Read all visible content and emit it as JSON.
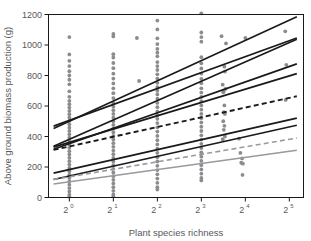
{
  "chart_data": {
    "type": "scatter",
    "title": "",
    "xlabel": "Plant species richness",
    "ylabel": "Above ground biomass production (g)",
    "xtick_labels": [
      "2",
      "2",
      "2",
      "2",
      "2",
      "2"
    ],
    "xtick_exponents": [
      "0",
      "1",
      "2",
      "3",
      "4",
      "5"
    ],
    "xtick_values": [
      1,
      2,
      4,
      8,
      16,
      32
    ],
    "xscale": "log2",
    "xlim": [
      0.72,
      40
    ],
    "ytick_labels": [
      "0",
      "200",
      "400",
      "600",
      "800",
      "1000",
      "1200"
    ],
    "ytick_values": [
      0,
      200,
      400,
      600,
      800,
      1000,
      1200
    ],
    "ylim": [
      0,
      1200
    ],
    "grid": false,
    "legend": "none",
    "series": [
      {
        "name": "regression-line-1",
        "style": "solid",
        "color": "#1a1a1a",
        "width": 1.7,
        "x": [
          0.78,
          36
        ],
        "y": [
          452,
          1185
        ]
      },
      {
        "name": "regression-line-2",
        "style": "solid",
        "color": "#1a1a1a",
        "width": 1.7,
        "x": [
          0.78,
          36
        ],
        "y": [
          468,
          1046
        ]
      },
      {
        "name": "regression-line-3",
        "style": "solid",
        "color": "#1a1a1a",
        "width": 1.7,
        "x": [
          0.78,
          36
        ],
        "y": [
          336,
          1038
        ]
      },
      {
        "name": "regression-line-4",
        "style": "solid",
        "color": "#1a1a1a",
        "width": 1.7,
        "x": [
          0.78,
          36
        ],
        "y": [
          316,
          876
        ]
      },
      {
        "name": "regression-line-5",
        "style": "solid",
        "color": "#1a1a1a",
        "width": 1.7,
        "x": [
          0.78,
          36
        ],
        "y": [
          330,
          812
        ]
      },
      {
        "name": "regression-line-dashed-black",
        "style": "dashed",
        "color": "#1a1a1a",
        "width": 1.9,
        "x": [
          0.78,
          36
        ],
        "y": [
          312,
          664
        ]
      },
      {
        "name": "regression-line-6",
        "style": "solid",
        "color": "#1a1a1a",
        "width": 1.7,
        "x": [
          0.78,
          36
        ],
        "y": [
          160,
          520
        ]
      },
      {
        "name": "regression-line-7",
        "style": "solid",
        "color": "#1a1a1a",
        "width": 1.7,
        "x": [
          0.78,
          36
        ],
        "y": [
          118,
          474
        ]
      },
      {
        "name": "regression-line-dashed-gray",
        "style": "dashed",
        "color": "#9a9a9e",
        "width": 1.6,
        "x": [
          0.78,
          36
        ],
        "y": [
          118,
          390
        ]
      },
      {
        "name": "regression-line-gray",
        "style": "solid",
        "color": "#9a9a9e",
        "width": 1.6,
        "x": [
          0.78,
          36
        ],
        "y": [
          88,
          310
        ]
      }
    ],
    "point_color": "#8c8c90",
    "points": [
      {
        "x": 1,
        "y": 1052
      },
      {
        "x": 1,
        "y": 938
      },
      {
        "x": 1,
        "y": 896
      },
      {
        "x": 1,
        "y": 862
      },
      {
        "x": 1,
        "y": 828
      },
      {
        "x": 1,
        "y": 800
      },
      {
        "x": 1,
        "y": 772
      },
      {
        "x": 1,
        "y": 742
      },
      {
        "x": 1,
        "y": 696
      },
      {
        "x": 1,
        "y": 660
      },
      {
        "x": 1,
        "y": 634
      },
      {
        "x": 1,
        "y": 612
      },
      {
        "x": 1,
        "y": 590
      },
      {
        "x": 1,
        "y": 568
      },
      {
        "x": 1,
        "y": 546
      },
      {
        "x": 1,
        "y": 524
      },
      {
        "x": 1,
        "y": 502
      },
      {
        "x": 1,
        "y": 480
      },
      {
        "x": 1,
        "y": 458
      },
      {
        "x": 1,
        "y": 436
      },
      {
        "x": 1,
        "y": 414
      },
      {
        "x": 1,
        "y": 392
      },
      {
        "x": 1,
        "y": 370
      },
      {
        "x": 1,
        "y": 348
      },
      {
        "x": 1,
        "y": 326
      },
      {
        "x": 1,
        "y": 304
      },
      {
        "x": 1,
        "y": 282
      },
      {
        "x": 1,
        "y": 260
      },
      {
        "x": 1,
        "y": 238
      },
      {
        "x": 1,
        "y": 216
      },
      {
        "x": 1,
        "y": 194
      },
      {
        "x": 1,
        "y": 172
      },
      {
        "x": 1,
        "y": 150
      },
      {
        "x": 1,
        "y": 128
      },
      {
        "x": 1,
        "y": 106
      },
      {
        "x": 1,
        "y": 84
      },
      {
        "x": 1,
        "y": 62
      },
      {
        "x": 1,
        "y": 40
      },
      {
        "x": 1,
        "y": 18
      },
      {
        "x": 1,
        "y": 6
      },
      {
        "x": 2,
        "y": 1072
      },
      {
        "x": 2,
        "y": 1056
      },
      {
        "x": 2,
        "y": 940
      },
      {
        "x": 2,
        "y": 918
      },
      {
        "x": 2,
        "y": 882
      },
      {
        "x": 2,
        "y": 848
      },
      {
        "x": 2,
        "y": 812
      },
      {
        "x": 2,
        "y": 780
      },
      {
        "x": 2,
        "y": 748
      },
      {
        "x": 2,
        "y": 716
      },
      {
        "x": 2,
        "y": 684
      },
      {
        "x": 2,
        "y": 652
      },
      {
        "x": 2,
        "y": 620
      },
      {
        "x": 2,
        "y": 596
      },
      {
        "x": 2,
        "y": 572
      },
      {
        "x": 2,
        "y": 548
      },
      {
        "x": 2,
        "y": 524
      },
      {
        "x": 2,
        "y": 500
      },
      {
        "x": 2,
        "y": 476
      },
      {
        "x": 2,
        "y": 452
      },
      {
        "x": 2,
        "y": 428
      },
      {
        "x": 2,
        "y": 404
      },
      {
        "x": 2,
        "y": 380
      },
      {
        "x": 2,
        "y": 356
      },
      {
        "x": 2,
        "y": 332
      },
      {
        "x": 2,
        "y": 308
      },
      {
        "x": 2,
        "y": 284
      },
      {
        "x": 2,
        "y": 260
      },
      {
        "x": 2,
        "y": 236
      },
      {
        "x": 2,
        "y": 212
      },
      {
        "x": 2,
        "y": 188
      },
      {
        "x": 2,
        "y": 164
      },
      {
        "x": 2,
        "y": 140
      },
      {
        "x": 2,
        "y": 116
      },
      {
        "x": 2,
        "y": 92
      },
      {
        "x": 2,
        "y": 68
      },
      {
        "x": 2,
        "y": 44
      },
      {
        "x": 2,
        "y": 20
      },
      {
        "x": 2,
        "y": 8
      },
      {
        "x": 2.9,
        "y": 1046
      },
      {
        "x": 3.0,
        "y": 764
      },
      {
        "x": 4,
        "y": 1160
      },
      {
        "x": 4,
        "y": 1102
      },
      {
        "x": 4,
        "y": 1044
      },
      {
        "x": 4,
        "y": 1006
      },
      {
        "x": 4,
        "y": 974
      },
      {
        "x": 4,
        "y": 950
      },
      {
        "x": 4,
        "y": 926
      },
      {
        "x": 4,
        "y": 888
      },
      {
        "x": 4,
        "y": 862
      },
      {
        "x": 4,
        "y": 836
      },
      {
        "x": 4,
        "y": 808
      },
      {
        "x": 4,
        "y": 780
      },
      {
        "x": 4,
        "y": 752
      },
      {
        "x": 4,
        "y": 724
      },
      {
        "x": 4,
        "y": 700
      },
      {
        "x": 4,
        "y": 676
      },
      {
        "x": 4,
        "y": 648
      },
      {
        "x": 4,
        "y": 620
      },
      {
        "x": 4,
        "y": 592
      },
      {
        "x": 4,
        "y": 564
      },
      {
        "x": 4,
        "y": 540
      },
      {
        "x": 4,
        "y": 516
      },
      {
        "x": 4,
        "y": 488
      },
      {
        "x": 4,
        "y": 460
      },
      {
        "x": 4,
        "y": 432
      },
      {
        "x": 4,
        "y": 404
      },
      {
        "x": 4,
        "y": 376
      },
      {
        "x": 4,
        "y": 348
      },
      {
        "x": 4,
        "y": 320
      },
      {
        "x": 4,
        "y": 292
      },
      {
        "x": 4,
        "y": 264
      },
      {
        "x": 4,
        "y": 236
      },
      {
        "x": 4,
        "y": 208
      },
      {
        "x": 4,
        "y": 180
      },
      {
        "x": 4,
        "y": 152
      },
      {
        "x": 4,
        "y": 124
      },
      {
        "x": 4,
        "y": 96
      },
      {
        "x": 4,
        "y": 68
      },
      {
        "x": 4,
        "y": 52
      },
      {
        "x": 8,
        "y": 1208
      },
      {
        "x": 8,
        "y": 1082
      },
      {
        "x": 8,
        "y": 1052
      },
      {
        "x": 8,
        "y": 1022
      },
      {
        "x": 8,
        "y": 920
      },
      {
        "x": 8,
        "y": 880
      },
      {
        "x": 8,
        "y": 846
      },
      {
        "x": 8,
        "y": 812
      },
      {
        "x": 8,
        "y": 778
      },
      {
        "x": 8,
        "y": 750
      },
      {
        "x": 8,
        "y": 716
      },
      {
        "x": 8,
        "y": 688
      },
      {
        "x": 8,
        "y": 660
      },
      {
        "x": 8,
        "y": 632
      },
      {
        "x": 8,
        "y": 604
      },
      {
        "x": 8,
        "y": 576
      },
      {
        "x": 8,
        "y": 548
      },
      {
        "x": 8,
        "y": 520
      },
      {
        "x": 8,
        "y": 492
      },
      {
        "x": 8,
        "y": 464
      },
      {
        "x": 8,
        "y": 436
      },
      {
        "x": 8,
        "y": 408
      },
      {
        "x": 8,
        "y": 380
      },
      {
        "x": 8,
        "y": 352
      },
      {
        "x": 8,
        "y": 324
      },
      {
        "x": 8,
        "y": 296
      },
      {
        "x": 8,
        "y": 268
      },
      {
        "x": 8,
        "y": 240
      },
      {
        "x": 8,
        "y": 212
      },
      {
        "x": 8,
        "y": 184
      },
      {
        "x": 8,
        "y": 156
      },
      {
        "x": 8,
        "y": 128
      },
      {
        "x": 8,
        "y": 112
      },
      {
        "x": 11,
        "y": 1058
      },
      {
        "x": 11.8,
        "y": 1010
      },
      {
        "x": 11.5,
        "y": 858
      },
      {
        "x": 11.6,
        "y": 826
      },
      {
        "x": 11.2,
        "y": 740
      },
      {
        "x": 11.7,
        "y": 712
      },
      {
        "x": 11.4,
        "y": 698
      },
      {
        "x": 11.3,
        "y": 690
      },
      {
        "x": 11.5,
        "y": 604
      },
      {
        "x": 11.4,
        "y": 560
      },
      {
        "x": 11.6,
        "y": 548
      },
      {
        "x": 11.3,
        "y": 500
      },
      {
        "x": 11.5,
        "y": 470
      },
      {
        "x": 11.4,
        "y": 444
      },
      {
        "x": 11.6,
        "y": 400
      },
      {
        "x": 11.2,
        "y": 382
      },
      {
        "x": 14.5,
        "y": 386
      },
      {
        "x": 14.8,
        "y": 292
      },
      {
        "x": 15.2,
        "y": 256
      },
      {
        "x": 15.0,
        "y": 228
      },
      {
        "x": 15.4,
        "y": 222
      },
      {
        "x": 15.3,
        "y": 148
      },
      {
        "x": 16,
        "y": 1046
      },
      {
        "x": 30,
        "y": 1090
      },
      {
        "x": 30.5,
        "y": 870
      },
      {
        "x": 30.2,
        "y": 640
      }
    ]
  },
  "axis": {
    "y_title": "Above ground biomass production (g)",
    "x_title": "Plant species richness"
  }
}
